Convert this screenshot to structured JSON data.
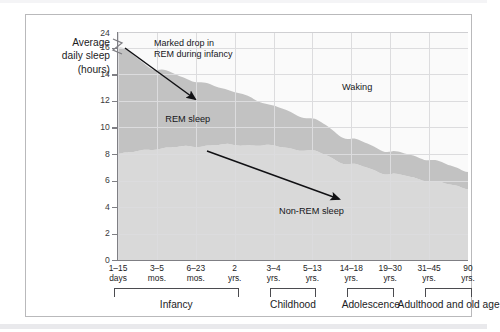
{
  "figure": {
    "axis_title_lines": [
      "Average",
      "daily sleep",
      "(hours)"
    ],
    "y_axis_has_break": true
  },
  "chart_data": {
    "type": "area",
    "title": "",
    "subtitle": "",
    "xlabel": "",
    "ylabel": "Average daily sleep (hours)",
    "ylim": [
      0,
      17.2
    ],
    "y_break_between": [
      16,
      24
    ],
    "yticks": [
      0,
      2,
      4,
      6,
      8,
      10,
      12,
      14,
      16,
      24
    ],
    "ytick_labels": [
      "0",
      "2",
      "4",
      "6",
      "8",
      "10",
      "12",
      "14",
      "16",
      "24"
    ],
    "grid": true,
    "legend_position": "in-plot-annotations",
    "categories": [
      "1–15 days",
      "3–5 mos.",
      "6–23 mos.",
      "2 yrs.",
      "3–4 yrs.",
      "5–13 yrs.",
      "14–18 yrs.",
      "19–30 yrs.",
      "31–45 yrs.",
      "90 yrs."
    ],
    "xtick_labels": [
      {
        "line1": "1–15",
        "line2": "days"
      },
      {
        "line1": "3–5",
        "line2": "mos."
      },
      {
        "line1": "6–23",
        "line2": "mos."
      },
      {
        "line1": "2",
        "line2": "yrs."
      },
      {
        "line1": "3–4",
        "line2": "yrs."
      },
      {
        "line1": "5–13",
        "line2": "yrs."
      },
      {
        "line1": "14–18",
        "line2": "yrs."
      },
      {
        "line1": "19–30",
        "line2": "yrs."
      },
      {
        "line1": "31–45",
        "line2": "yrs."
      },
      {
        "line1": "90",
        "line2": "yrs."
      }
    ],
    "series": [
      {
        "name": "Non-REM sleep",
        "color": "#d8d8d8",
        "note": "lower band, from 0 up to non_rem boundary",
        "values": [
          8.0,
          8.4,
          8.6,
          8.7,
          8.6,
          8.2,
          7.2,
          6.5,
          6.0,
          5.4
        ]
      },
      {
        "name": "REM sleep",
        "color": "#c2c2c2",
        "note": "upper band, stacked on Non-REM up to total sleep",
        "values": [
          8.0,
          6.0,
          4.9,
          4.0,
          3.0,
          2.4,
          1.9,
          1.7,
          1.6,
          1.3
        ]
      },
      {
        "name": "Total sleep",
        "color": "#c2c2c2",
        "note": "top edge of stacked bands",
        "values": [
          16.0,
          14.4,
          13.5,
          12.7,
          11.6,
          10.6,
          9.1,
          8.2,
          7.6,
          6.7
        ]
      }
    ],
    "annotations": [
      {
        "id": "waking",
        "text": "Waking",
        "x_frac": 0.64,
        "y_hours": 13.0
      },
      {
        "id": "rem-sleep",
        "text": "REM sleep",
        "x_frac": 0.135,
        "y_hours": 10.6
      },
      {
        "id": "non-rem-sleep",
        "text": "Non-REM sleep",
        "x_frac": 0.46,
        "y_hours": 3.6
      },
      {
        "id": "marked-drop",
        "text_line1": "Marked drop in",
        "text_line2": "REM during infancy",
        "x_frac": 0.12,
        "y_hours": 16.4
      }
    ],
    "arrows": [
      {
        "id": "rem-drop-arrow",
        "from": [
          125,
          48
        ],
        "to": [
          195,
          99
        ]
      },
      {
        "id": "non-rem-decline-arrow",
        "from": [
          207,
          151
        ],
        "to": [
          339,
          199
        ]
      }
    ],
    "stages": [
      {
        "label": "Infancy",
        "start_index": 0,
        "end_index": 3
      },
      {
        "label": "Childhood",
        "start_index": 4,
        "end_index": 5
      },
      {
        "label": "Adolescence",
        "start_index": 6,
        "end_index": 7
      },
      {
        "label": "Adulthood and old age",
        "start_index": 8,
        "end_index": 9
      }
    ]
  },
  "colors": {
    "rem_band": "#c2c2c2",
    "non_rem_band": "#d9d9d9",
    "waking": "#fafafa",
    "grid": "#dcdcde",
    "axis": "#7f7f84",
    "text": "#1c1c1e",
    "frame": "#b9b9bb"
  }
}
